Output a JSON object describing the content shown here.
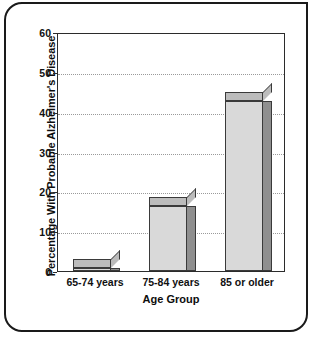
{
  "chart_data": {
    "type": "bar",
    "title": "",
    "categories": [
      "65-74 years",
      "75-84 years",
      "85 or older"
    ],
    "values": [
      3,
      18.5,
      45
    ],
    "xlabel": "Age Group",
    "ylabel": "Percentage With Probable Alzheimer's Disease",
    "ylim": [
      0,
      60
    ],
    "yticks": [
      0,
      10,
      20,
      30,
      40,
      50,
      60
    ],
    "ytick_labels": [
      "0",
      "10",
      "20",
      "30",
      "40",
      "50",
      "60"
    ],
    "grid": "horizontal-dotted",
    "legend": "none",
    "bar_style": "3d-shaded",
    "colors": {
      "bar_front": "#d9d9d9",
      "bar_side": "#8f8f8f",
      "bar_top": "#bcbcbc",
      "bar_outline": "#3a3a3a",
      "axis": "#2b2b2b",
      "grid": "#9a9a9a",
      "text": "#111111",
      "frame": "#1a1a1a",
      "background": "#ffffff"
    }
  }
}
